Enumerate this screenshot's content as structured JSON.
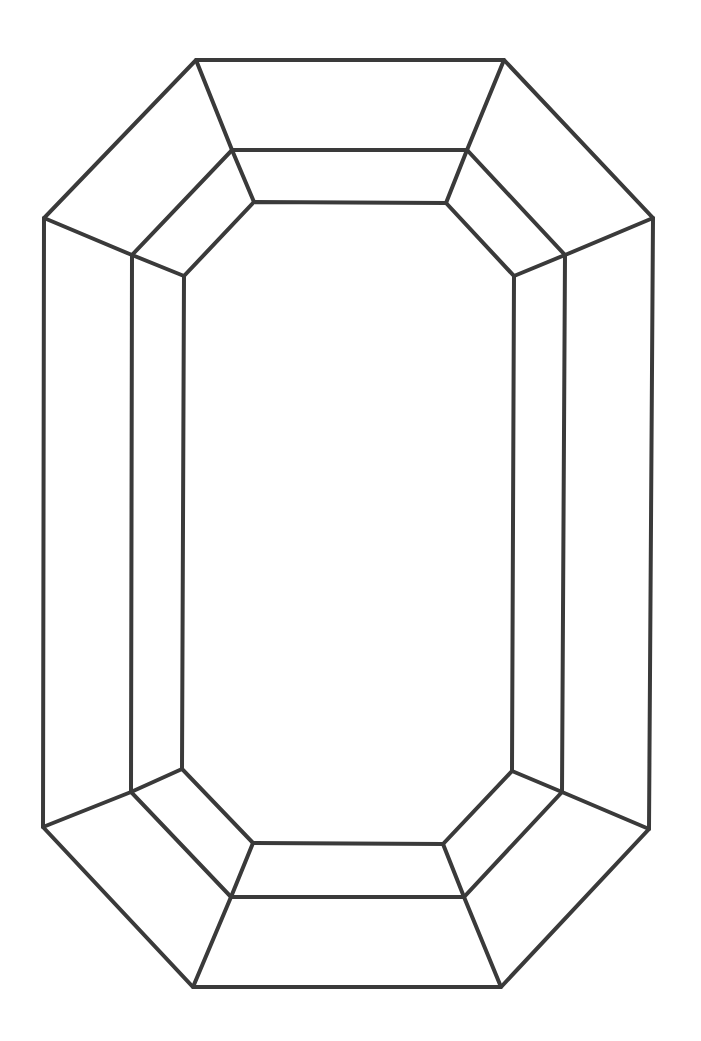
{
  "diagram": {
    "stroke_color": "#3a3a3a",
    "stroke_width": 4,
    "background": "#ffffff",
    "outer_outline": [
      [
        196,
        60
      ],
      [
        504,
        60
      ],
      [
        653,
        218
      ],
      [
        649,
        829
      ],
      [
        501,
        987
      ],
      [
        193,
        987
      ],
      [
        43,
        827
      ],
      [
        44,
        218
      ]
    ],
    "middle_outline": [
      [
        232,
        150
      ],
      [
        467,
        150
      ],
      [
        565,
        255
      ],
      [
        562,
        792
      ],
      [
        464,
        897
      ],
      [
        231,
        897
      ],
      [
        131,
        792
      ],
      [
        132,
        255
      ]
    ],
    "inner_table": [
      [
        254,
        202
      ],
      [
        446,
        203
      ],
      [
        514,
        276
      ],
      [
        512,
        771
      ],
      [
        443,
        844
      ],
      [
        253,
        843
      ],
      [
        182,
        769
      ],
      [
        184,
        276
      ]
    ],
    "facet_connectors": [
      [
        [
          196,
          60
        ],
        [
          232,
          150
        ]
      ],
      [
        [
          232,
          150
        ],
        [
          254,
          202
        ]
      ],
      [
        [
          504,
          60
        ],
        [
          467,
          150
        ]
      ],
      [
        [
          467,
          150
        ],
        [
          446,
          203
        ]
      ],
      [
        [
          653,
          218
        ],
        [
          565,
          255
        ]
      ],
      [
        [
          565,
          255
        ],
        [
          514,
          276
        ]
      ],
      [
        [
          649,
          829
        ],
        [
          562,
          792
        ]
      ],
      [
        [
          562,
          792
        ],
        [
          512,
          771
        ]
      ],
      [
        [
          501,
          987
        ],
        [
          464,
          897
        ]
      ],
      [
        [
          464,
          897
        ],
        [
          443,
          844
        ]
      ],
      [
        [
          193,
          987
        ],
        [
          231,
          897
        ]
      ],
      [
        [
          231,
          897
        ],
        [
          253,
          843
        ]
      ],
      [
        [
          43,
          827
        ],
        [
          131,
          792
        ]
      ],
      [
        [
          131,
          792
        ],
        [
          182,
          769
        ]
      ],
      [
        [
          44,
          218
        ],
        [
          132,
          255
        ]
      ],
      [
        [
          132,
          255
        ],
        [
          184,
          276
        ]
      ]
    ]
  }
}
